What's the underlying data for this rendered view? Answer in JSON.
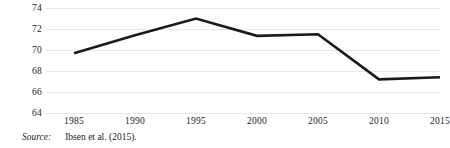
{
  "figure": {
    "background_color": "#ffffff",
    "source_label": "Source:",
    "source_text": "Ibsen et al. (2015)."
  },
  "chart_data": {
    "type": "line",
    "title": "",
    "subtitle": "",
    "xlabel": "",
    "ylabel": "",
    "categories": [
      "1985",
      "1990",
      "1995",
      "2000",
      "2005",
      "2010",
      "2015"
    ],
    "x": [
      1985,
      1990,
      1995,
      2000,
      2005,
      2010,
      2015
    ],
    "values": [
      69.7,
      71.4,
      73.0,
      71.35,
      71.5,
      67.2,
      67.4
    ],
    "series": [
      {
        "name": "",
        "values": [
          69.7,
          71.4,
          73.0,
          71.35,
          71.5,
          67.2,
          67.4
        ],
        "color": "#1a1a1a",
        "line_width": 2.6
      }
    ],
    "ylim": [
      64,
      74
    ],
    "yticks": [
      64,
      66,
      68,
      70,
      72,
      74
    ],
    "ytick_labels": [
      "64",
      "66",
      "68",
      "70",
      "72",
      "74"
    ],
    "xlim": [
      1985,
      2015
    ],
    "xticks": [
      1985,
      1990,
      1995,
      2000,
      2005,
      2010,
      2015
    ],
    "xtick_labels": [
      "1985",
      "1990",
      "1995",
      "2000",
      "2005",
      "2010",
      "2015"
    ],
    "grid": true,
    "grid_axis": "y",
    "grid_color": "#e7e7e7",
    "legend": false,
    "legend_position": "none",
    "markers": false,
    "annotations": []
  }
}
